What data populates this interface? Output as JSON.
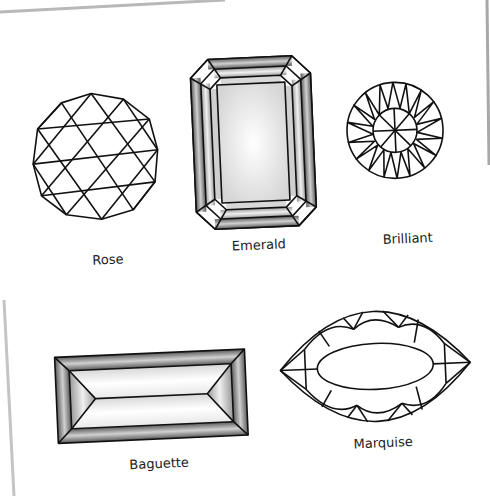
{
  "figure": {
    "type": "gem-cut-diagram",
    "rotation_deg": -2.5,
    "colors": {
      "page": "#ffffff",
      "page_edge_shadow": "#b8b8b8",
      "line": "#111111",
      "facet_dark": "#6e6e6e",
      "facet_light": "#f4f4f4"
    },
    "cuts": [
      {
        "id": "rose",
        "label": "Rose"
      },
      {
        "id": "emerald",
        "label": "Emerald"
      },
      {
        "id": "brilliant",
        "label": "Brilliant"
      },
      {
        "id": "baguette",
        "label": "Baguette"
      },
      {
        "id": "marquise",
        "label": "Marquise"
      }
    ]
  }
}
